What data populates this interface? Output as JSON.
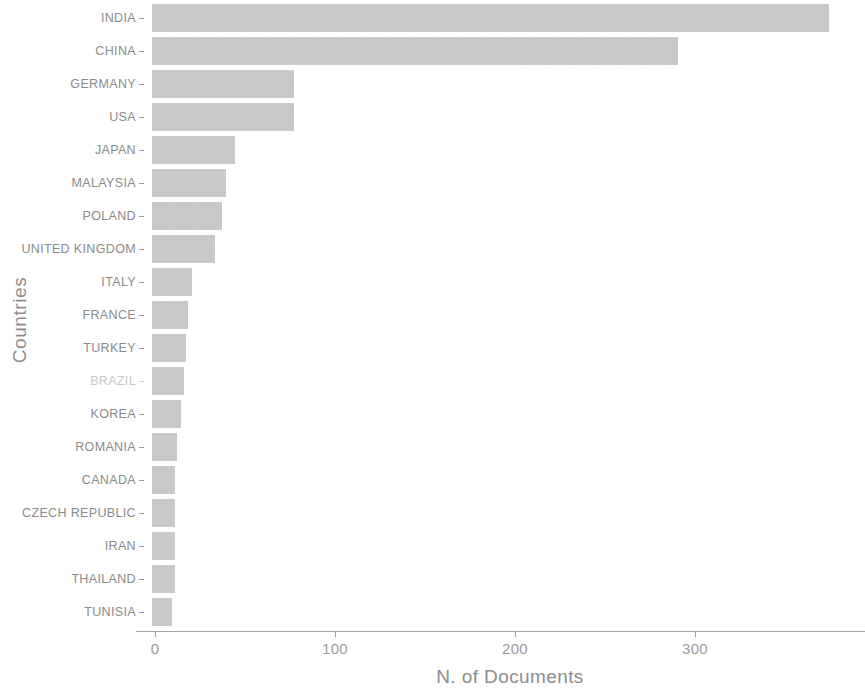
{
  "chart_data": {
    "type": "bar",
    "orientation": "horizontal",
    "title": "",
    "xlabel": "N. of Documents",
    "ylabel": "Countries",
    "categories": [
      "INDIA",
      "CHINA",
      "GERMANY",
      "USA",
      "JAPAN",
      "MALAYSIA",
      "POLAND",
      "UNITED KINGDOM",
      "ITALY",
      "FRANCE",
      "TURKEY",
      "BRAZIL",
      "KOREA",
      "ROMANIA",
      "CANADA",
      "CZECH REPUBLIC",
      "IRAN",
      "THAILAND",
      "TUNISIA"
    ],
    "values": [
      376,
      292,
      79,
      79,
      46,
      41,
      39,
      35,
      22,
      20,
      19,
      18,
      16,
      14,
      13,
      13,
      13,
      13,
      11
    ],
    "xlim": [
      0,
      390
    ],
    "xticks": [
      0,
      100,
      200,
      300
    ],
    "xticklabels": [
      "0",
      "100",
      "200",
      "300"
    ],
    "grid": false,
    "legend": null,
    "bar_color": "#c2c2c2",
    "text_color": "#8d8d8d",
    "axis_color": "#a6a6a6",
    "faded_categories": [
      "BRAZIL"
    ]
  }
}
